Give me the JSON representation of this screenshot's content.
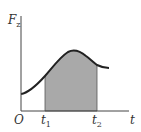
{
  "diagram": {
    "type": "force-time graph",
    "y_axis": {
      "label": "F",
      "subscript": "z"
    },
    "x_axis": {
      "label": "t"
    },
    "origin_label": "O",
    "markers": [
      {
        "label": "t",
        "subscript": "1"
      },
      {
        "label": "t",
        "subscript": "2"
      }
    ],
    "shaded_region": "area under curve between t1 and t2",
    "colors": {
      "curve": "#222222",
      "axes": "#444444",
      "shade": "#a9a9a9",
      "text": "#333333"
    }
  }
}
